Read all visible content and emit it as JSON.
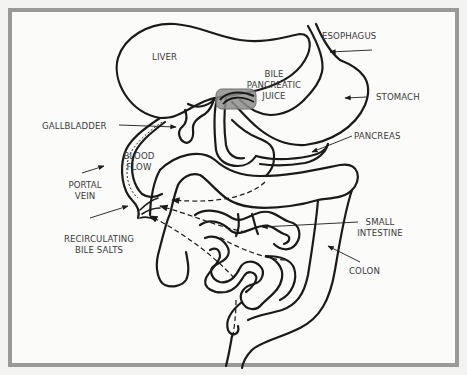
{
  "diagram": {
    "colors": {
      "background": "#fbfbfa",
      "frame": "#9a9a98",
      "stroke": "#1a1a1a",
      "highlight": "#8e8e8c",
      "text": "#3a3a3a"
    },
    "labels": {
      "liver": "LIVER",
      "esophagus": "ESOPHAGUS",
      "bile_line1": "BILE",
      "bile_line2": "PANCREATIC",
      "bile_line3": "JUICE",
      "stomach": "STOMACH",
      "gallbladder": "GALLBLADDER",
      "pancreas": "PANCREAS",
      "blood_flow_line1": "BLOOD",
      "blood_flow_line2": "FLOW",
      "portal_vein_line1": "PORTAL",
      "portal_vein_line2": "VEIN",
      "small_intestine_line1": "SMALL",
      "small_intestine_line2": "INTESTINE",
      "recirculating_line1": "RECIRCULATING",
      "recirculating_line2": "BILE SALTS",
      "colon": "COLON"
    }
  }
}
